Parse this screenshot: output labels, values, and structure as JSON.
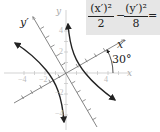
{
  "equation": {
    "term1_numerator": "(x′)²",
    "term1_denominator": "2",
    "operator": "−",
    "term2_numerator": "(y′)²",
    "term2_denominator": "8",
    "equals": "= 1",
    "box_color": "#e6e6e6"
  },
  "axes": {
    "x_label": "x",
    "y_label": "y",
    "x_prime_label": "x′",
    "y_prime_label": "y′",
    "rotation_angle_label": "30°",
    "x_ticks": [
      {
        "label": "−4",
        "value": -4
      },
      {
        "label": "−2",
        "value": -2
      },
      {
        "label": "4",
        "value": 4
      }
    ],
    "y_ticks": [
      {
        "label": "4",
        "value": 4
      },
      {
        "label": "2",
        "value": 2
      },
      {
        "label": "−2",
        "value": -2
      },
      {
        "label": "−4",
        "value": -4
      }
    ],
    "axis_color": "#c8c8c8",
    "rotated_axis_color": "#8a8a8a",
    "curve_color": "#222222"
  },
  "curve": {
    "type": "hyperbola",
    "a_squared": 2,
    "b_squared": 8,
    "rotation_degrees": 30
  }
}
